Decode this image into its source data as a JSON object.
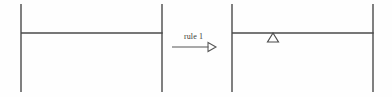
{
  "figure": {
    "kind": "graph-transformation-diagram",
    "background_color": "#fefefe",
    "stroke_color": "#4a4a4a",
    "label_color": "#3a3a3a",
    "left_graph": {
      "name": "left-host-graph",
      "vertical_edges": [
        {
          "x": 21,
          "y1": 4,
          "y2": 92
        },
        {
          "x": 162,
          "y1": 4,
          "y2": 92
        }
      ],
      "horizontal_edges": [
        {
          "y": 33,
          "x1": 21,
          "x2": 162
        }
      ],
      "markers": []
    },
    "transformation": {
      "name": "rule-arrow",
      "label": "rule 1",
      "label_x": 184,
      "label_y": 33,
      "shaft": {
        "x1": 172,
        "y1": 47,
        "x2": 209,
        "y2": 47
      },
      "arrowhead": {
        "style": "hollow-triangle",
        "tip_x": 216,
        "tip_y": 47
      }
    },
    "right_graph": {
      "name": "right-result-graph",
      "vertical_edges": [
        {
          "x": 232,
          "y1": 4,
          "y2": 92
        },
        {
          "x": 373,
          "y1": 4,
          "y2": 92
        }
      ],
      "horizontal_edges": [
        {
          "y": 33,
          "x1": 232,
          "x2": 373
        }
      ],
      "markers": [
        {
          "type": "triangle-marker",
          "label": "Δ",
          "x": 273,
          "y": 33,
          "width": 11,
          "height": 9,
          "orientation": "up",
          "fill": "none"
        }
      ]
    }
  }
}
